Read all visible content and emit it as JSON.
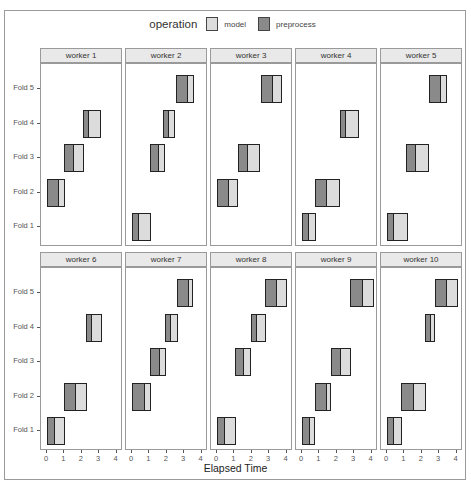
{
  "legend": {
    "title": "operation",
    "items": [
      {
        "label": "model",
        "color": "#dcdcdc"
      },
      {
        "label": "preprocess",
        "color": "#8a8a8a"
      }
    ]
  },
  "colors": {
    "model": "#dcdcdc",
    "preprocess": "#8a8a8a",
    "strip": "#e9e9e9",
    "border": "#222222"
  },
  "x_axis": {
    "title": "Elapsed Time",
    "ticks": [
      "0",
      "1",
      "2",
      "3",
      "4"
    ]
  },
  "y_axis": {
    "ticks": [
      "Fold 1",
      "Fold 2",
      "Fold 3",
      "Fold 4",
      "Fold 5"
    ]
  },
  "chart_data": {
    "type": "gantt (faceted horizontal range bars)",
    "title": "",
    "xlabel": "Elapsed Time",
    "ylabel": "",
    "xlim": [
      0,
      4
    ],
    "x_ticks": [
      0,
      1,
      2,
      3,
      4
    ],
    "y_categories": [
      "Fold 1",
      "Fold 2",
      "Fold 3",
      "Fold 4",
      "Fold 5"
    ],
    "legend": {
      "title": "operation",
      "entries": [
        "model",
        "preprocess"
      ],
      "position": "top"
    },
    "facet_by": "worker",
    "facets": [
      {
        "worker": "worker 1",
        "tasks": [
          {
            "fold": "Fold 4",
            "preprocess": [
              2.05,
              2.3
            ],
            "model": [
              2.3,
              3.1
            ]
          },
          {
            "fold": "Fold 3",
            "preprocess": [
              0.97,
              1.43
            ],
            "model": [
              1.43,
              2.1
            ]
          },
          {
            "fold": "Fold 2",
            "preprocess": [
              0.0,
              0.56
            ],
            "model": [
              0.56,
              1.02
            ]
          }
        ]
      },
      {
        "worker": "worker 2",
        "tasks": [
          {
            "fold": "Fold 5",
            "preprocess": [
              2.5,
              3.08
            ],
            "model": [
              3.08,
              3.54
            ]
          },
          {
            "fold": "Fold 4",
            "preprocess": [
              1.81,
              2.0
            ],
            "model": [
              2.0,
              2.47
            ]
          },
          {
            "fold": "Fold 3",
            "preprocess": [
              1.05,
              1.45
            ],
            "model": [
              1.45,
              1.87
            ]
          },
          {
            "fold": "Fold 1",
            "preprocess": [
              0.0,
              0.27
            ],
            "model": [
              0.27,
              1.1
            ]
          }
        ]
      },
      {
        "worker": "worker 3",
        "tasks": [
          {
            "fold": "Fold 5",
            "preprocess": [
              2.5,
              3.1
            ],
            "model": [
              3.1,
              3.75
            ]
          },
          {
            "fold": "Fold 3",
            "preprocess": [
              1.2,
              1.64
            ],
            "model": [
              1.64,
              2.5
            ]
          },
          {
            "fold": "Fold 2",
            "preprocess": [
              0.0,
              0.55
            ],
            "model": [
              0.55,
              1.2
            ]
          }
        ]
      },
      {
        "worker": "worker 4",
        "tasks": [
          {
            "fold": "Fold 4",
            "preprocess": [
              2.17,
              2.4
            ],
            "model": [
              2.4,
              3.26
            ]
          },
          {
            "fold": "Fold 2",
            "preprocess": [
              0.76,
              1.35
            ],
            "model": [
              1.35,
              2.2
            ]
          },
          {
            "fold": "Fold 1",
            "preprocess": [
              0.0,
              0.3
            ],
            "model": [
              0.3,
              0.78
            ]
          }
        ]
      },
      {
        "worker": "worker 5",
        "tasks": [
          {
            "fold": "Fold 5",
            "preprocess": [
              2.4,
              3.0
            ],
            "model": [
              3.0,
              3.43
            ]
          },
          {
            "fold": "Fold 3",
            "preprocess": [
              1.12,
              1.58
            ],
            "model": [
              1.58,
              2.42
            ]
          },
          {
            "fold": "Fold 1",
            "preprocess": [
              0.0,
              0.27
            ],
            "model": [
              0.27,
              1.18
            ]
          }
        ]
      },
      {
        "worker": "worker 6",
        "tasks": [
          {
            "fold": "Fold 4",
            "preprocess": [
              2.27,
              2.5
            ],
            "model": [
              2.5,
              3.14
            ]
          },
          {
            "fold": "Fold 2",
            "preprocess": [
              1.0,
              1.54
            ],
            "model": [
              1.54,
              2.29
            ]
          },
          {
            "fold": "Fold 1",
            "preprocess": [
              0.0,
              0.33
            ],
            "model": [
              0.33,
              1.02
            ]
          }
        ]
      },
      {
        "worker": "worker 7",
        "tasks": [
          {
            "fold": "Fold 5",
            "preprocess": [
              2.6,
              3.18
            ],
            "model": [
              3.18,
              3.5
            ]
          },
          {
            "fold": "Fold 4",
            "preprocess": [
              1.9,
              2.13
            ],
            "model": [
              2.13,
              2.63
            ]
          },
          {
            "fold": "Fold 3",
            "preprocess": [
              1.05,
              1.49
            ],
            "model": [
              1.49,
              1.94
            ]
          },
          {
            "fold": "Fold 2",
            "preprocess": [
              0.0,
              0.61
            ],
            "model": [
              0.61,
              1.09
            ]
          }
        ]
      },
      {
        "worker": "worker 8",
        "tasks": [
          {
            "fold": "Fold 5",
            "preprocess": [
              2.76,
              3.35
            ],
            "model": [
              3.35,
              4.0
            ]
          },
          {
            "fold": "Fold 4",
            "preprocess": [
              1.94,
              2.19
            ],
            "model": [
              2.19,
              2.82
            ]
          },
          {
            "fold": "Fold 3",
            "preprocess": [
              1.05,
              1.45
            ],
            "model": [
              1.45,
              1.96
            ]
          },
          {
            "fold": "Fold 1",
            "preprocess": [
              0.0,
              0.36
            ],
            "model": [
              0.36,
              1.07
            ]
          }
        ]
      },
      {
        "worker": "worker 9",
        "tasks": [
          {
            "fold": "Fold 5",
            "preprocess": [
              2.76,
              3.41
            ],
            "model": [
              3.41,
              4.15
            ]
          },
          {
            "fold": "Fold 3",
            "preprocess": [
              1.64,
              2.1
            ],
            "model": [
              2.1,
              2.8
            ]
          },
          {
            "fold": "Fold 2",
            "preprocess": [
              0.74,
              1.3
            ],
            "model": [
              1.3,
              1.67
            ]
          },
          {
            "fold": "Fold 1",
            "preprocess": [
              0.0,
              0.36
            ],
            "model": [
              0.36,
              0.74
            ]
          }
        ]
      },
      {
        "worker": "worker 10",
        "tasks": [
          {
            "fold": "Fold 5",
            "preprocess": [
              2.74,
              3.33
            ],
            "model": [
              3.33,
              4.1
            ]
          },
          {
            "fold": "Fold 4",
            "preprocess": [
              2.21,
              2.4
            ],
            "model": [
              2.4,
              2.78
            ]
          },
          {
            "fold": "Fold 2",
            "preprocess": [
              0.82,
              1.41
            ],
            "model": [
              1.41,
              2.23
            ]
          },
          {
            "fold": "Fold 1",
            "preprocess": [
              0.0,
              0.3
            ],
            "model": [
              0.3,
              0.86
            ]
          }
        ]
      }
    ],
    "grid": true
  }
}
